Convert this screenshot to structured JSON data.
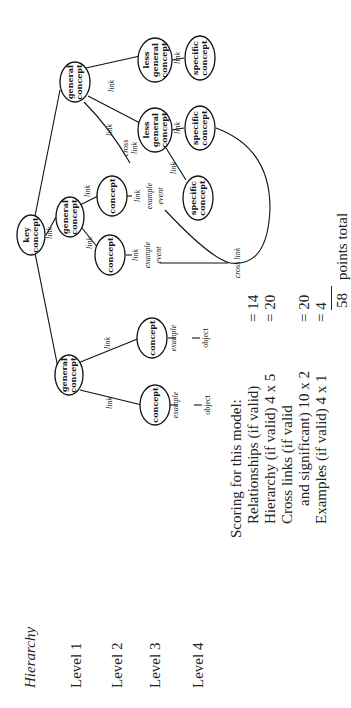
{
  "levels": {
    "title": "Hierarchy",
    "items": [
      "Level 1",
      "Level 2",
      "Level 3",
      "Level 4"
    ]
  },
  "nodes": {
    "key": [
      "key",
      "concept"
    ],
    "general": [
      "general",
      "concept"
    ],
    "concept": "concept",
    "less_general": [
      "less",
      "general",
      "concept"
    ],
    "specific": [
      "specific",
      "concept"
    ]
  },
  "labels": {
    "link": "link",
    "cross_link": [
      "cross",
      "link"
    ],
    "cross_link_inline": "cross link",
    "example": "example",
    "object": "object",
    "event": "event",
    "link_example_event": [
      "link",
      "example",
      "event"
    ]
  },
  "scoring": {
    "heading": "Scoring for this model:",
    "rows": [
      {
        "label": "Relationships (if valid)",
        "value": "= 14"
      },
      {
        "label": "Hierarchy (if valid) 4 x 5",
        "value": "= 20"
      },
      {
        "label": "Cross links (if valid",
        "value": ""
      },
      {
        "label": "and significant) 10 x 2",
        "value": "= 20"
      },
      {
        "label": "Examples (if valid) 4 x 1",
        "value": "= 4"
      }
    ],
    "total_value": "58",
    "total_label": "points total"
  }
}
